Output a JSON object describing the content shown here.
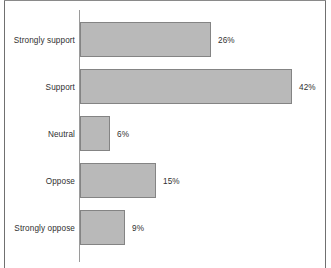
{
  "chart_data": {
    "type": "bar",
    "orientation": "horizontal",
    "title": "",
    "subtitle": "",
    "xlabel": "",
    "ylabel": "",
    "categories": [
      "Strongly support",
      "Support",
      "Neutral",
      "Oppose",
      "Strongly oppose"
    ],
    "values": [
      26,
      42,
      6,
      15,
      9
    ],
    "value_labels": [
      "26%",
      "42%",
      "6%",
      "15%",
      "9%"
    ],
    "xlim": [
      0,
      42
    ],
    "grid": false,
    "legend": null,
    "annotations": []
  },
  "style": {
    "bar_fill": "#b9b9b9",
    "bar_stroke": "#848484",
    "axis_color": "#9a9a9a",
    "frame_color": "#707070",
    "text_color": "#303030",
    "background": "#ffffff"
  },
  "layout": {
    "axis_x_px": 79,
    "bar_start_px": 80,
    "px_per_percent": 5.05,
    "row_tops_px": [
      22,
      69,
      116,
      163,
      210
    ],
    "row_height_px": 35,
    "value_gap_px": 7
  }
}
